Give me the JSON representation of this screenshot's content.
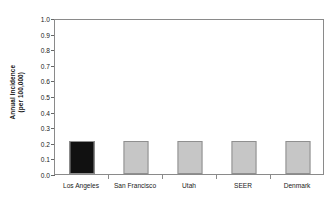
{
  "chart_data": {
    "type": "bar",
    "title": "",
    "subtitle": "",
    "xlabel": "",
    "ylabel": "Annual Incidence (per 100,000)",
    "ylabel_lines": [
      "Annual Incidence",
      "(per 100,000)"
    ],
    "categories": [
      "Los Angeles",
      "San Francisco",
      "Utah",
      "SEER",
      "Denmark"
    ],
    "values": [
      0.21,
      0.21,
      0.21,
      0.21,
      0.21
    ],
    "bar_colors": [
      "#111111",
      "#c6c6c6",
      "#c6c6c6",
      "#c6c6c6",
      "#c6c6c6"
    ],
    "bar_border_color": "#8f8f8f",
    "ylim": [
      0.0,
      1.0
    ],
    "y_tick_step": 0.1,
    "y_tick_labels": [
      "1.0",
      "0.9",
      "0.8",
      "0.7",
      "0.6",
      "0.5",
      "0.4",
      "0.3",
      "0.2",
      "0.1",
      "0.0"
    ],
    "y_tick_values": [
      1.0,
      0.9,
      0.8,
      0.7,
      0.6,
      0.5,
      0.4,
      0.3,
      0.2,
      0.1,
      0.0
    ],
    "grid": false,
    "legend": false,
    "legend_position": "none",
    "frame": true,
    "annotations": [],
    "background_color": "#ffffff",
    "axis_color": "#8a8a8a"
  }
}
